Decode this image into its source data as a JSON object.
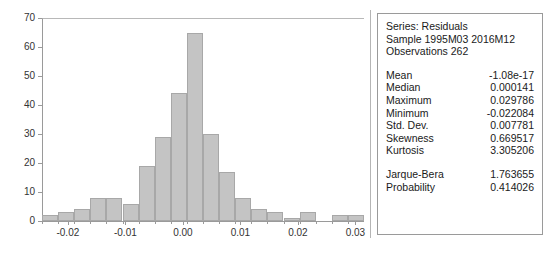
{
  "chart_data": {
    "type": "bar",
    "title": "",
    "xlabel": "",
    "ylabel": "",
    "xlim": [
      -0.0245,
      0.0315
    ],
    "ylim": [
      0,
      70
    ],
    "grid": false,
    "legend_position": "right",
    "y_ticks": [
      70,
      60,
      50,
      40,
      30,
      20,
      10,
      0
    ],
    "x_ticks": [
      -0.02,
      -0.01,
      0.0,
      0.01,
      0.02,
      0.03
    ],
    "x_tick_labels": [
      "-0.02",
      "-0.01",
      "0.00",
      "0.01",
      "0.02",
      "0.03"
    ],
    "bin_width": 0.0028,
    "bin_starts": [
      -0.0245,
      -0.0217,
      -0.0189,
      -0.0161,
      -0.0133,
      -0.0105,
      -0.0077,
      -0.0049,
      -0.0021,
      0.0007,
      0.0035,
      0.0063,
      0.0091,
      0.0119,
      0.0147,
      0.0175,
      0.0203,
      0.0231,
      0.0259,
      0.0287
    ],
    "categories": [
      "-0.0245",
      "-0.0217",
      "-0.0189",
      "-0.0161",
      "-0.0133",
      "-0.0105",
      "-0.0077",
      "-0.0049",
      "-0.0021",
      "0.0007",
      "0.0035",
      "0.0063",
      "0.0091",
      "0.0119",
      "0.0147",
      "0.0175",
      "0.0203",
      "0.0231",
      "0.0259",
      "0.0287"
    ],
    "values": [
      2,
      3,
      4,
      8,
      8,
      6,
      19,
      29,
      44,
      65,
      30,
      17,
      8,
      4,
      3,
      1,
      3,
      0,
      2,
      2
    ],
    "bar_fill_color": "#c4c4c4",
    "bar_edge_color": "#a8a8a8",
    "axis_color": "#9a9a9a"
  },
  "stats_box": {
    "series_line": "Series: Residuals",
    "sample_line": "Sample 1995M03 2016M12",
    "observations_line": "Observations 262",
    "rows": [
      {
        "label": "Mean",
        "value": "-1.08e-17"
      },
      {
        "label": "Median",
        "value": "0.000141"
      },
      {
        "label": "Maximum",
        "value": "0.029786"
      },
      {
        "label": "Minimum",
        "value": "-0.022084"
      },
      {
        "label": "Std. Dev.",
        "value": "0.007781"
      },
      {
        "label": "Skewness",
        "value": "0.669517"
      },
      {
        "label": "Kurtosis",
        "value": "3.305206"
      }
    ],
    "test_rows": [
      {
        "label": "Jarque-Bera",
        "value": "1.763655"
      },
      {
        "label": "Probability",
        "value": "0.414026"
      }
    ]
  }
}
